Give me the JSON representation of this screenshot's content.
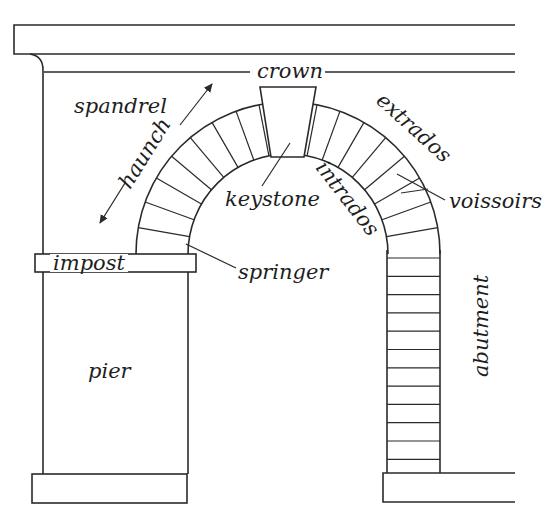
{
  "diagram": {
    "colors": {
      "line": "#2a2a2a",
      "background": "#ffffff",
      "text": "#1e1e1e"
    },
    "labels": {
      "crown": "crown",
      "spandrel": "spandrel",
      "haunch": "haunch",
      "keystone": "keystone",
      "extrados": "extrados",
      "intrados": "intrados",
      "voissoirs": "voissoirs",
      "impost": "impost",
      "springer": "springer",
      "pier": "pier",
      "abutment": "abutment"
    },
    "components": [
      "cornice",
      "entablature-line",
      "left-wall",
      "keystone",
      "voussoir-ring",
      "impost-block",
      "pier",
      "pier-base",
      "abutment-column",
      "abutment-base"
    ]
  }
}
